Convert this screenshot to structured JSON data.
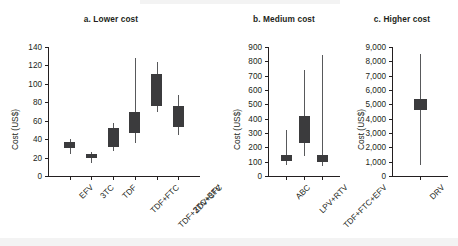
{
  "figure": {
    "y_axis_label": "Cost (US$)",
    "background": "#ffffff",
    "box_color": "#3b3b3d",
    "whisker_color": "#58595b",
    "axis_color": "#231f20"
  },
  "chart_data": [
    {
      "type": "box",
      "panel": "a",
      "title": "a. Lower cost",
      "xlabel": "",
      "ylabel": "Cost (US$)",
      "ylim": [
        0,
        140
      ],
      "yticks": [
        0,
        20,
        40,
        60,
        80,
        100,
        120,
        140
      ],
      "ytick_labels": [
        "0",
        "20",
        "40",
        "60",
        "80",
        "100",
        "120",
        "140"
      ],
      "grid": false,
      "legend": "none",
      "categories": [
        "EFV",
        "3TC",
        "TDF",
        "TDF+FTC",
        "TDF+3TC+EFV",
        "ZDV+3TC"
      ],
      "boxes": [
        {
          "category": "EFV",
          "low": 24,
          "q1": 30,
          "q3": 37,
          "high": 40
        },
        {
          "category": "3TC",
          "low": 14,
          "q1": 19,
          "q3": 24,
          "high": 26
        },
        {
          "category": "TDF",
          "low": 27,
          "q1": 32,
          "q3": 52,
          "high": 58
        },
        {
          "category": "TDF+FTC",
          "low": 36,
          "q1": 47,
          "q3": 69,
          "high": 128
        },
        {
          "category": "TDF+3TC+EFV",
          "low": 69,
          "q1": 76,
          "q3": 111,
          "high": 124
        },
        {
          "category": "ZDV+3TC",
          "low": 44,
          "q1": 53,
          "q3": 76,
          "high": 88
        }
      ]
    },
    {
      "type": "box",
      "panel": "b",
      "title": "b. Medium cost",
      "xlabel": "",
      "ylabel": "Cost (US$)",
      "ylim": [
        0,
        900
      ],
      "yticks": [
        0,
        100,
        200,
        300,
        400,
        500,
        600,
        700,
        800,
        900
      ],
      "ytick_labels": [
        "0",
        "100",
        "200",
        "300",
        "400",
        "500",
        "600",
        "700",
        "800",
        "900"
      ],
      "grid": false,
      "legend": "none",
      "categories": [
        "ABC",
        "LPV+RTV",
        "TDF+FTC+EFV"
      ],
      "boxes": [
        {
          "category": "ABC",
          "low": 75,
          "q1": 105,
          "q3": 150,
          "high": 320
        },
        {
          "category": "LPV+RTV",
          "low": 140,
          "q1": 230,
          "q3": 420,
          "high": 740
        },
        {
          "category": "TDF+FTC+EFV",
          "low": 70,
          "q1": 100,
          "q3": 145,
          "high": 845
        }
      ]
    },
    {
      "type": "box",
      "panel": "c",
      "title": "c. Higher cost",
      "xlabel": "",
      "ylabel": "Cost (US$)",
      "ylim": [
        0,
        9000
      ],
      "yticks": [
        0,
        1000,
        2000,
        3000,
        4000,
        5000,
        6000,
        7000,
        8000,
        9000
      ],
      "ytick_labels": [
        "0",
        "1,000",
        "2,000",
        "3,000",
        "4,000",
        "5,000",
        "6,000",
        "7,000",
        "8,000",
        "9,000"
      ],
      "grid": false,
      "legend": "none",
      "categories": [
        "DRV"
      ],
      "boxes": [
        {
          "category": "DRV",
          "low": 800,
          "q1": 4600,
          "q3": 5400,
          "high": 8500
        }
      ]
    }
  ]
}
